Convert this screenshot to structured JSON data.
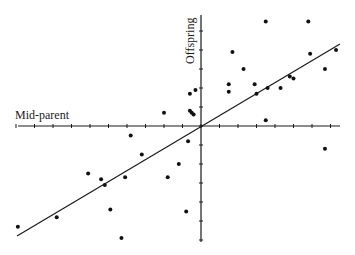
{
  "chart_data": {
    "type": "scatter",
    "title": "",
    "xlabel": "Mid-parent",
    "ylabel": "Offspring",
    "grid": false,
    "legend": null,
    "axes": {
      "origin_px": [
        201,
        126
      ],
      "x_range_px": [
        18,
        340
      ],
      "y_range_px": [
        15,
        242
      ],
      "x_tick_spacing_px": 18.5,
      "y_tick_spacing_px": 19,
      "x_ticks_left": 10,
      "x_ticks_right": 7,
      "y_ticks_up": 5,
      "y_ticks_down": 6
    },
    "units": "tick units relative to axis crossing (x right positive, y up positive)",
    "points": [
      {
        "x": -9.9,
        "y": -5.3
      },
      {
        "x": -7.8,
        "y": -4.8
      },
      {
        "x": -6.1,
        "y": -2.5
      },
      {
        "x": -5.4,
        "y": -2.8
      },
      {
        "x": -5.2,
        "y": -3.1
      },
      {
        "x": -4.9,
        "y": -4.4
      },
      {
        "x": -4.3,
        "y": -5.9
      },
      {
        "x": -4.1,
        "y": -2.7
      },
      {
        "x": -3.8,
        "y": -0.5
      },
      {
        "x": -3.2,
        "y": -1.5
      },
      {
        "x": -1.8,
        "y": -2.7
      },
      {
        "x": -1.2,
        "y": -2.0
      },
      {
        "x": -0.8,
        "y": -4.5
      },
      {
        "x": -0.7,
        "y": -0.8
      },
      {
        "x": -2.0,
        "y": 0.7
      },
      {
        "x": -0.6,
        "y": 1.7
      },
      {
        "x": -0.3,
        "y": 1.9
      },
      {
        "x": -0.6,
        "y": 0.8
      },
      {
        "x": -0.5,
        "y": 0.7
      },
      {
        "x": -0.4,
        "y": 0.6
      },
      {
        "x": 1.5,
        "y": 2.2
      },
      {
        "x": 1.5,
        "y": 1.8
      },
      {
        "x": 1.7,
        "y": 3.9
      },
      {
        "x": 2.3,
        "y": 3.0
      },
      {
        "x": 2.9,
        "y": 2.2
      },
      {
        "x": 3.0,
        "y": 1.7
      },
      {
        "x": 3.5,
        "y": 5.5
      },
      {
        "x": 3.6,
        "y": 2.0
      },
      {
        "x": 3.5,
        "y": 0.3
      },
      {
        "x": 4.3,
        "y": 2.0
      },
      {
        "x": 4.8,
        "y": 2.6
      },
      {
        "x": 5.0,
        "y": 2.5
      },
      {
        "x": 5.8,
        "y": 5.5
      },
      {
        "x": 5.9,
        "y": 3.8
      },
      {
        "x": 6.7,
        "y": 3.0
      },
      {
        "x": 7.3,
        "y": 4.0
      },
      {
        "x": 6.7,
        "y": -1.2
      }
    ],
    "regression_line": {
      "slope": 0.58,
      "intercept": 0,
      "x_extent": [
        -9.8,
        7.5
      ],
      "endpoints_px": [
        [
          17,
          236
        ],
        [
          340,
          44
        ]
      ]
    }
  }
}
